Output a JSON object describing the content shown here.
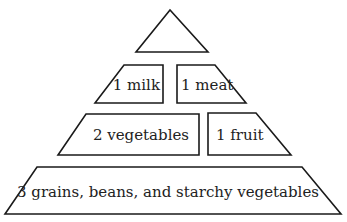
{
  "diagram": {
    "type": "food-pyramid",
    "tiers": [
      {
        "level": 1,
        "sections": [
          {
            "id": "top",
            "label": "",
            "shape": "triangle"
          }
        ]
      },
      {
        "level": 2,
        "sections": [
          {
            "id": "milk",
            "label": "1 milk",
            "shape": "trapezoid"
          },
          {
            "id": "meat",
            "label": "1 meat",
            "shape": "trapezoid"
          }
        ]
      },
      {
        "level": 3,
        "sections": [
          {
            "id": "vegetables",
            "label": "2 vegetables",
            "shape": "trapezoid"
          },
          {
            "id": "fruit",
            "label": "1 fruit",
            "shape": "trapezoid"
          }
        ]
      },
      {
        "level": 4,
        "sections": [
          {
            "id": "grains",
            "label": "3 grains, beans, and starchy vegetables",
            "shape": "trapezoid"
          }
        ]
      }
    ]
  },
  "labels": {
    "milk": "1 milk",
    "meat": "1 meat",
    "vegetables": "2 vegetables",
    "fruit": "1 fruit",
    "grains": "3 grains, beans, and starchy vegetables"
  },
  "colors": {
    "stroke": "#1a1a1a",
    "fill": "#ffffff",
    "text": "#222222"
  }
}
